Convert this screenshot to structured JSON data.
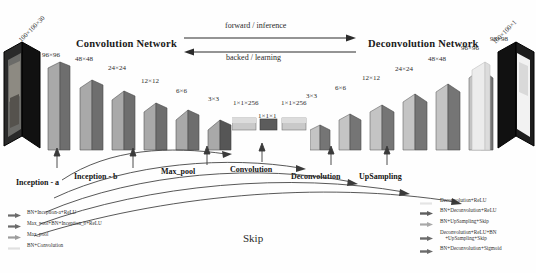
{
  "title_left": "Convolution Network",
  "title_right": "Deconvolution Network",
  "flow": {
    "forward": "forward / inference",
    "backward": "backed / learning"
  },
  "skip_label": "Skip",
  "io": {
    "input_dim": "100×100×30",
    "output_dim": "100×100×1"
  },
  "encoder_dims": [
    "96×96",
    "48×48",
    "24×24",
    "12×12",
    "6×6",
    "3×3"
  ],
  "bottleneck_dims": [
    "1×1×256",
    "1×1×1",
    "1×1×256"
  ],
  "decoder_dims": [
    "3×3",
    "6×6",
    "12×12",
    "24×24",
    "48×48",
    "96×96",
    "98×98"
  ],
  "stage_labels": [
    {
      "name": "inception-a",
      "text": "Inception - a"
    },
    {
      "name": "inception-b",
      "text": "Inception - b"
    },
    {
      "name": "max-pool",
      "text": "Max_pool"
    },
    {
      "name": "convolution",
      "text": "Convolution"
    },
    {
      "name": "deconvolution",
      "text": "Deconvolution"
    },
    {
      "name": "upsampling",
      "text": "UpSampling"
    }
  ],
  "legend_left": [
    {
      "text": "BN+Inception-a+ReLU",
      "arrow": true,
      "swatch": "#9a9a9a"
    },
    {
      "text": "Max_pool+BN+Inception_b+ReLU",
      "arrow": true,
      "swatch": "#9a9a9a"
    },
    {
      "text": "Max_pool",
      "arrow": true,
      "swatch": "#b0b0b0"
    },
    {
      "text": "BN+Convolution",
      "arrow": false,
      "swatch": "#d6d6d6"
    }
  ],
  "legend_right": [
    {
      "text": "Deconvolution+ReLU",
      "arrow": false,
      "swatch": "#dcdcdc"
    },
    {
      "text": "BN+Deconvolution+ReLU",
      "arrow": true,
      "swatch": "#8f8f8f"
    },
    {
      "text": "BN+UpSampling+Skip",
      "arrow": true,
      "swatch": "#c2c2c2"
    },
    {
      "text": "Deconvolution+ReLU+BN\n    +UpSampling+Skip",
      "arrow": true,
      "swatch": "#9a9a9a"
    },
    {
      "text": "BN+Deconvolution+Sigmoid",
      "arrow": true,
      "swatch": "#9a9a9a"
    }
  ],
  "colors": {
    "front_light": "#b9b9b9",
    "side_dark": "#6f6f6f",
    "stroke": "#3a3a3a",
    "text": "#231f20"
  }
}
